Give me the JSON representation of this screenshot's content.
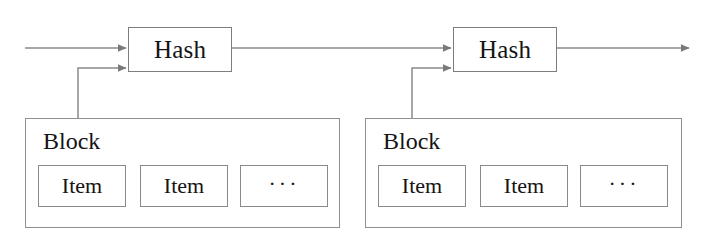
{
  "diagram": {
    "type": "block-chain-structure",
    "colors": {
      "background": "#ffffff",
      "stroke": "#8a8a8a",
      "text": "#141414"
    },
    "units": [
      {
        "id": "unit-1",
        "hash": {
          "label": "Hash",
          "x": 128,
          "y": 27,
          "width": 104,
          "height": 45
        },
        "block": {
          "label": "Block",
          "x": 25,
          "y": 118,
          "width": 315,
          "height": 110,
          "label_x": 42,
          "label_y": 128,
          "items": [
            {
              "label": "Item",
              "x": 38,
              "y": 165,
              "width": 88,
              "height": 42
            },
            {
              "label": "Item",
              "x": 140,
              "y": 165,
              "width": 88,
              "height": 42
            },
            {
              "label": "···",
              "x": 240,
              "y": 165,
              "width": 88,
              "height": 42
            }
          ]
        }
      },
      {
        "id": "unit-2",
        "hash": {
          "label": "Hash",
          "x": 453,
          "y": 27,
          "width": 104,
          "height": 45
        },
        "block": {
          "label": "Block",
          "x": 365,
          "y": 118,
          "width": 317,
          "height": 110,
          "label_x": 382,
          "label_y": 128,
          "items": [
            {
              "label": "Item",
              "x": 378,
              "y": 165,
              "width": 88,
              "height": 42
            },
            {
              "label": "Item",
              "x": 480,
              "y": 165,
              "width": 88,
              "height": 42
            },
            {
              "label": "···",
              "x": 580,
              "y": 165,
              "width": 88,
              "height": 42
            }
          ]
        }
      }
    ],
    "connections": [
      {
        "name": "chain-input-arrow",
        "from": "left-edge",
        "to": "hash-1",
        "y": 48
      },
      {
        "name": "block-1-to-hash-1-arrow",
        "from": "block-1-top",
        "to": "hash-1",
        "y": 68
      },
      {
        "name": "hash-1-to-hash-2-arrow",
        "from": "hash-1",
        "to": "hash-2",
        "y": 48
      },
      {
        "name": "block-2-to-hash-2-arrow",
        "from": "block-2-top",
        "to": "hash-2",
        "y": 68
      },
      {
        "name": "chain-output-arrow",
        "from": "hash-2",
        "to": "right-edge",
        "y": 48
      }
    ]
  }
}
